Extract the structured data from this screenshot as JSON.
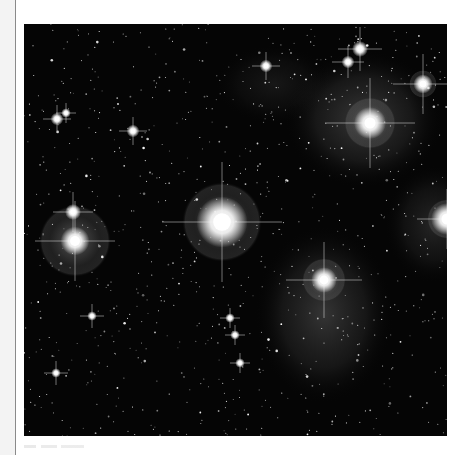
{
  "document": {
    "figure": {
      "subject": "Pleiades star cluster with reflection nebulosity",
      "background_color": "#050505",
      "nebula_color": "#9a9a9a",
      "star_color": "#ffffff",
      "bright_stars": [
        {
          "name": "alcyone",
          "x": 198,
          "y": 198,
          "r": 16,
          "halo": 40,
          "spikes": 60
        },
        {
          "name": "electra",
          "x": 51,
          "y": 217,
          "r": 9,
          "halo": 36,
          "spikes": 40
        },
        {
          "name": "electra-companion",
          "x": 49,
          "y": 188,
          "r": 5,
          "halo": 0,
          "spikes": 20
        },
        {
          "name": "maia",
          "x": 346,
          "y": 99,
          "r": 10,
          "halo": 26,
          "spikes": 45
        },
        {
          "name": "taygeta",
          "x": 399,
          "y": 60,
          "r": 6,
          "halo": 14,
          "spikes": 30
        },
        {
          "name": "atlas",
          "x": 300,
          "y": 256,
          "r": 8,
          "halo": 22,
          "spikes": 38
        },
        {
          "name": "celaeno",
          "x": 336,
          "y": 25,
          "r": 5,
          "halo": 0,
          "spikes": 22
        },
        {
          "name": "sterope",
          "x": 324,
          "y": 38,
          "r": 4,
          "halo": 0,
          "spikes": 16
        },
        {
          "name": "upper-left-1",
          "x": 33,
          "y": 95,
          "r": 4,
          "halo": 0,
          "spikes": 14
        },
        {
          "name": "upper-left-2",
          "x": 42,
          "y": 89,
          "r": 3,
          "halo": 0,
          "spikes": 10
        },
        {
          "name": "mid-left",
          "x": 109,
          "y": 107,
          "r": 4,
          "halo": 0,
          "spikes": 14
        },
        {
          "name": "upper-mid",
          "x": 242,
          "y": 42,
          "r": 4,
          "halo": 0,
          "spikes": 14
        },
        {
          "name": "chain-1",
          "x": 206,
          "y": 294,
          "r": 3,
          "halo": 0,
          "spikes": 10
        },
        {
          "name": "chain-2",
          "x": 211,
          "y": 311,
          "r": 3,
          "halo": 0,
          "spikes": 10
        },
        {
          "name": "chain-3",
          "x": 216,
          "y": 339,
          "r": 3,
          "halo": 0,
          "spikes": 10
        },
        {
          "name": "chain-4",
          "x": 68,
          "y": 292,
          "r": 3,
          "halo": 0,
          "spikes": 12
        },
        {
          "name": "lower-left",
          "x": 32,
          "y": 349,
          "r": 3,
          "halo": 0,
          "spikes": 12
        },
        {
          "name": "right-edge",
          "x": 423,
          "y": 195,
          "r": 10,
          "halo": 20,
          "spikes": 30
        }
      ],
      "nebulae": [
        {
          "x": 340,
          "y": 95,
          "rx": 80,
          "ry": 70,
          "opacity": 0.28
        },
        {
          "x": 300,
          "y": 290,
          "rx": 70,
          "ry": 90,
          "opacity": 0.26
        },
        {
          "x": 410,
          "y": 200,
          "rx": 50,
          "ry": 60,
          "opacity": 0.18
        },
        {
          "x": 250,
          "y": 60,
          "rx": 60,
          "ry": 40,
          "opacity": 0.1
        }
      ]
    },
    "caption": {
      "visible": true
    }
  }
}
